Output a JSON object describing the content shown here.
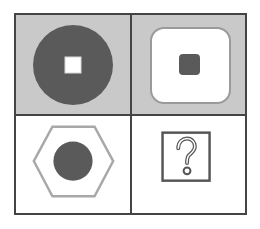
{
  "grid": {
    "rows": 2,
    "cols": 2,
    "border_color": "#444444",
    "cells": [
      {
        "position": "top-left",
        "background": "#c9c9c9",
        "shape": "filled-circle-with-white-square-center",
        "fill": "#5a5a5a",
        "inner_fill": "#ffffff"
      },
      {
        "position": "top-right",
        "background": "#c9c9c9",
        "shape": "white-rounded-square-with-dark-small-square",
        "outline": "#9a9a9a",
        "inner_fill": "#5a5a5a"
      },
      {
        "position": "bottom-left",
        "background": "#ffffff",
        "shape": "outlined-hexagon-with-filled-circle",
        "outline": "#a8a8a8",
        "inner_fill": "#5a5a5a"
      },
      {
        "position": "bottom-right",
        "background": "#ffffff",
        "shape": "question-mark-box",
        "outline": "#555555",
        "glyph": "?"
      }
    ]
  }
}
